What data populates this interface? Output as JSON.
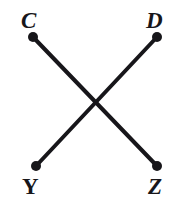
{
  "figure": {
    "background_color": "#ffffff",
    "stroke_color": "#17161a",
    "stroke_width": 4,
    "dot_color": "#17161a",
    "dot_radius": 5,
    "width": 175,
    "height": 201,
    "points": [
      {
        "id": "C",
        "label": "C",
        "style": "italic",
        "x": 33,
        "y": 37,
        "corner": "top-left"
      },
      {
        "id": "D",
        "label": "D",
        "style": "italic",
        "x": 157,
        "y": 37,
        "corner": "top-right"
      },
      {
        "id": "Y",
        "label": "Y",
        "style": "upright",
        "x": 36,
        "y": 166,
        "corner": "bottom-left"
      },
      {
        "id": "Z",
        "label": "Z",
        "style": "italic",
        "x": 157,
        "y": 166,
        "corner": "bottom-right"
      }
    ],
    "segments": [
      {
        "id": "CZ",
        "from": "C",
        "to": "Z",
        "x1": 33,
        "y1": 37,
        "x2": 157,
        "y2": 166
      },
      {
        "id": "DY",
        "from": "D",
        "to": "Y",
        "x1": 157,
        "y1": 37,
        "x2": 36,
        "y2": 166
      }
    ],
    "intersection": {
      "x": 95,
      "y": 103
    }
  }
}
